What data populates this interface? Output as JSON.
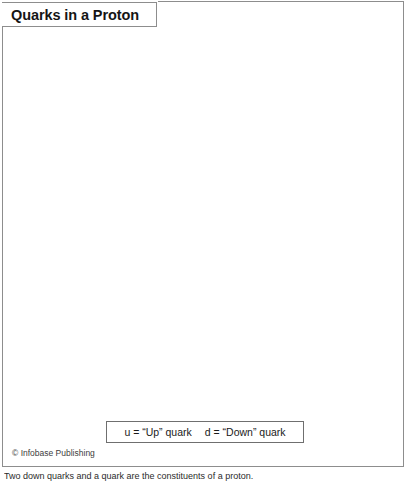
{
  "figure": {
    "title": "Quarks in a Proton",
    "credit_symbol": "©",
    "credit": "Infobase Publishing",
    "caption": "Two down quarks and a quark are the constituents of a proton."
  },
  "legend": {
    "entries": [
      "u = “Up” quark",
      "d = “Down” quark"
    ]
  },
  "diagram": {
    "proton": {
      "label": "proton",
      "cx": 204,
      "cy": 217,
      "r": 182,
      "fill_light": "#c6c6c6",
      "fill_dark": "#8f8f8f"
    },
    "quarks": [
      {
        "id": "up-quark-left",
        "label": "u",
        "cx": 123,
        "cy": 170,
        "r": 57,
        "fill_light": "#4a4a4a",
        "fill_dark": "#151515",
        "text_color": "#f2f2f2"
      },
      {
        "id": "up-quark-right",
        "label": "u",
        "cx": 296,
        "cy": 170,
        "r": 56,
        "fill_light": "#4a4a4a",
        "fill_dark": "#151515",
        "text_color": "#f2f2f2"
      },
      {
        "id": "down-quark",
        "label": "d",
        "cx": 209,
        "cy": 327,
        "r": 56,
        "fill_light": "#f0f0f0",
        "fill_dark": "#aeaeae",
        "text_color": "#1c1c1c"
      }
    ],
    "gluons": [
      {
        "id": "gluon-top",
        "color": "#ffffff"
      },
      {
        "id": "gluon-left",
        "color": "#ffffff"
      },
      {
        "id": "gluon-right",
        "color": "#ffffff"
      }
    ]
  }
}
